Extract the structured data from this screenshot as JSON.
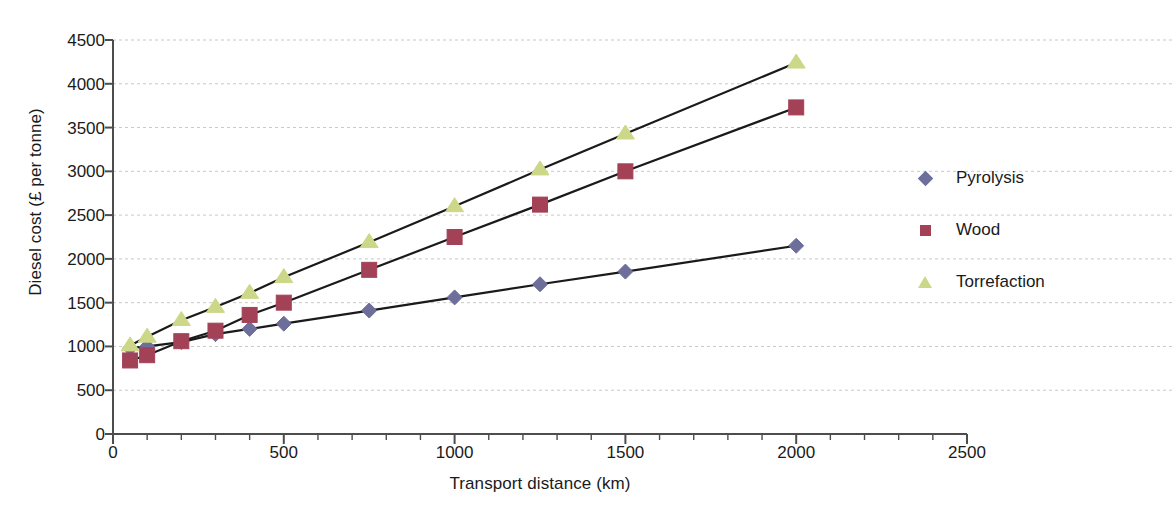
{
  "chart_data": {
    "type": "scatter",
    "title": "",
    "xlabel": "Transport distance (km)",
    "ylabel": "Diesel cost (£ per tonne)",
    "xlim": [
      0,
      2500
    ],
    "ylim": [
      0,
      4500
    ],
    "xticks": [
      0,
      500,
      1000,
      1500,
      2000,
      2500
    ],
    "yticks": [
      0,
      500,
      1000,
      1500,
      2000,
      2500,
      3000,
      3500,
      4000,
      4500
    ],
    "xtick_labels": [
      "0",
      "500",
      "1000",
      "1500",
      "2000",
      "2500"
    ],
    "ytick_labels": [
      "0",
      "500",
      "1000",
      "1500",
      "2000",
      "2500",
      "3000",
      "3500",
      "4000",
      "4500"
    ],
    "x_minor_tick_step": 100,
    "grid": "horizontal-dashed",
    "legend_position": "right",
    "x": [
      50,
      100,
      200,
      300,
      400,
      500,
      750,
      1000,
      1250,
      1500,
      2000
    ],
    "series": [
      {
        "name": "Pyrolysis",
        "marker": "diamond",
        "color": "#6e6e9b",
        "line_color": "#1a1a1a",
        "values": [
          980,
          1000,
          1050,
          1140,
          1200,
          1260,
          1410,
          1560,
          1710,
          1855,
          2150
        ]
      },
      {
        "name": "Wood",
        "marker": "square",
        "color": "#a34257",
        "line_color": "#1a1a1a",
        "values": [
          840,
          900,
          1060,
          1180,
          1360,
          1500,
          1875,
          2250,
          2620,
          3000,
          3730
        ]
      },
      {
        "name": "Torrefaction",
        "marker": "triangle",
        "color": "#cdd788",
        "line_color": "#1a1a1a",
        "values": [
          1010,
          1110,
          1300,
          1450,
          1610,
          1790,
          2190,
          2600,
          3020,
          3430,
          4240
        ]
      }
    ]
  },
  "legend": {
    "items": [
      {
        "label": "Pyrolysis"
      },
      {
        "label": "Wood"
      },
      {
        "label": "Torrefaction"
      }
    ]
  },
  "axes": {
    "x_title": "Transport distance (km)",
    "y_title": "Diesel cost (£ per tonne)"
  },
  "colors": {
    "pyrolysis": "#6e6e9b",
    "wood": "#a34257",
    "torrefaction": "#cdd788",
    "axis": "#4d4d4d",
    "grid": "#c8c8c8",
    "line": "#1a1a1a",
    "text": "#1a1a1a",
    "background": "#ffffff"
  }
}
